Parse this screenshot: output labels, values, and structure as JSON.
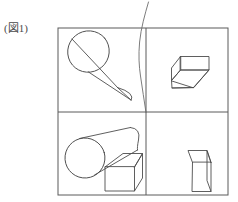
{
  "figure": {
    "caption": "(図1)",
    "colors": {
      "frame_stroke": "#5a5a5a",
      "solid_stroke": "#4d4d4d",
      "sketch_stroke": "#6d6d6d",
      "background": "#ffffff",
      "caption_text": "#4a4a4a"
    },
    "frame": {
      "x": 58,
      "y": 28,
      "width": 170,
      "height": 167,
      "divider_vertical_x": 146,
      "divider_horizontal_y": 112
    },
    "quadrants": [
      {
        "id": "top-left",
        "label": "top-left",
        "shapes": [
          "cylinder-diagonal"
        ]
      },
      {
        "id": "top-right",
        "label": "top-right",
        "shapes": [
          "wedge-prism"
        ]
      },
      {
        "id": "bottom-left",
        "label": "bottom-left",
        "shapes": [
          "cylinder-horizontal",
          "cuboid-wide"
        ]
      },
      {
        "id": "bottom-right",
        "label": "bottom-right",
        "shapes": [
          "cuboid-tall"
        ]
      }
    ],
    "annotation": {
      "name": "hand-drawn-curve",
      "description": "freehand curved stroke from top edge down to frame centre"
    }
  }
}
